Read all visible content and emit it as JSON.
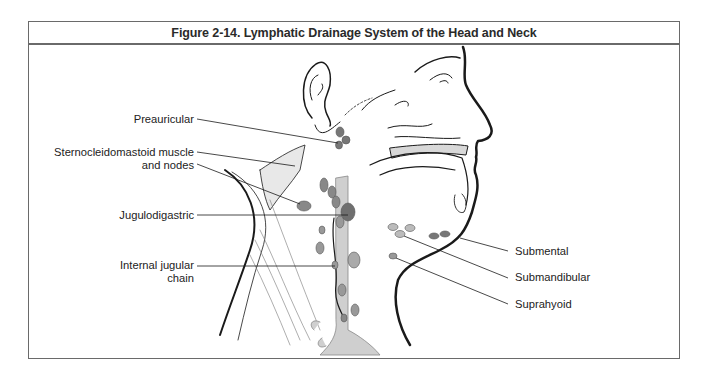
{
  "figure": {
    "title": "Figure 2-14. Lymphatic Drainage System of the Head and Neck",
    "colors": {
      "border": "#6a6a6a",
      "node_dark": "#7a7a7a",
      "node_light": "#b9b9b9",
      "vessel": "#cfcfcf",
      "line": "#1a1a1a"
    },
    "labels_left": [
      {
        "id": "preauricular",
        "lines": [
          "Preauricular"
        ]
      },
      {
        "id": "sternocleidomastoid",
        "lines": [
          "Sternocleidomastoid muscle",
          "and nodes"
        ]
      },
      {
        "id": "jugulodigastric",
        "lines": [
          "Jugulodigastric"
        ]
      },
      {
        "id": "internal-jugular",
        "lines": [
          "Internal jugular",
          "chain"
        ]
      }
    ],
    "labels_right": [
      {
        "id": "submental",
        "lines": [
          "Submental"
        ]
      },
      {
        "id": "submandibular",
        "lines": [
          "Submandibular"
        ]
      },
      {
        "id": "suprahyoid",
        "lines": [
          "Suprahyoid"
        ]
      }
    ]
  }
}
